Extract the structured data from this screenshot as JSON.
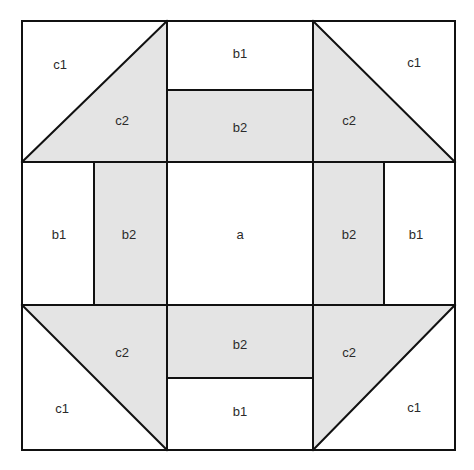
{
  "diagram": {
    "title": "",
    "colors": {
      "fill_shaded": "#e4e4e4",
      "fill_plain": "#ffffff",
      "stroke": "#111111",
      "label": "#2a2a2a"
    },
    "pieces": [
      {
        "id": "c1-top-left",
        "label": "c1",
        "x": 60,
        "y": 64
      },
      {
        "id": "c2-top-left",
        "label": "c2",
        "x": 122,
        "y": 120
      },
      {
        "id": "b1-top",
        "label": "b1",
        "x": 240,
        "y": 53
      },
      {
        "id": "b2-top",
        "label": "b2",
        "x": 240,
        "y": 127
      },
      {
        "id": "c2-top-right",
        "label": "c2",
        "x": 349,
        "y": 120
      },
      {
        "id": "c1-top-right",
        "label": "c1",
        "x": 414,
        "y": 62
      },
      {
        "id": "b1-left",
        "label": "b1",
        "x": 59,
        "y": 234
      },
      {
        "id": "b2-left",
        "label": "b2",
        "x": 129,
        "y": 234
      },
      {
        "id": "a-center",
        "label": "a",
        "x": 240,
        "y": 234
      },
      {
        "id": "b2-right",
        "label": "b2",
        "x": 349,
        "y": 234
      },
      {
        "id": "b1-right",
        "label": "b1",
        "x": 416,
        "y": 234
      },
      {
        "id": "c2-bottom-left",
        "label": "c2",
        "x": 122,
        "y": 352
      },
      {
        "id": "b2-bottom",
        "label": "b2",
        "x": 240,
        "y": 344
      },
      {
        "id": "c2-bottom-right",
        "label": "c2",
        "x": 349,
        "y": 352
      },
      {
        "id": "c1-bottom-left",
        "label": "c1",
        "x": 62,
        "y": 408
      },
      {
        "id": "b1-bottom",
        "label": "b1",
        "x": 240,
        "y": 411
      },
      {
        "id": "c1-bottom-right",
        "label": "c1",
        "x": 414,
        "y": 407
      }
    ]
  }
}
